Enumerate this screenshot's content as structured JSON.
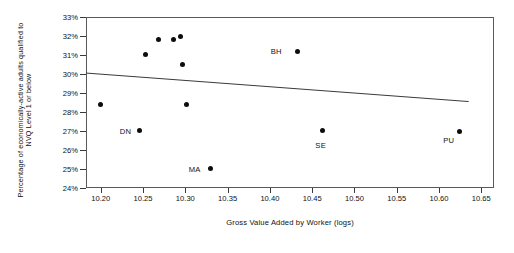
{
  "chart_data": {
    "type": "scatter",
    "title": "",
    "xlabel": "Gross Value Added by Worker (logs)",
    "ylabel": "Percentage of economically-active adults qualified to NVQ Level 1 or below",
    "ylabel_line1": "Percentage of economically-active adults qualified to",
    "ylabel_line2": "NVQ Level 1 or below",
    "xlim": [
      10.1825,
      10.665
    ],
    "ylim": [
      24,
      33
    ],
    "xticks": [
      "10.20",
      "10.25",
      "10.30",
      "10.35",
      "10.40",
      "10.45",
      "10.50",
      "10.55",
      "10.60",
      "10.65"
    ],
    "xtick_values": [
      10.2,
      10.25,
      10.3,
      10.35,
      10.4,
      10.45,
      10.5,
      10.55,
      10.6,
      10.65
    ],
    "yticks": [
      "24%",
      "25%",
      "26%",
      "27%",
      "28%",
      "29%",
      "30%",
      "31%",
      "32%",
      "33%"
    ],
    "ytick_values": [
      24,
      25,
      26,
      27,
      28,
      29,
      30,
      31,
      32,
      33
    ],
    "grid": false,
    "legend": "none",
    "marker_color": "#0d0d0d",
    "line_color": "#3a3a3a",
    "frame_color": "#5a5a5a",
    "points": [
      {
        "x": 10.2,
        "y": 28.4,
        "label": ""
      },
      {
        "x": 10.246,
        "y": 27.05,
        "label": "DN",
        "label_dx": -20,
        "label_dy": 1
      },
      {
        "x": 10.253,
        "y": 31.05,
        "label": ""
      },
      {
        "x": 10.268,
        "y": 31.8,
        "label": ""
      },
      {
        "x": 10.286,
        "y": 31.8,
        "label": ""
      },
      {
        "x": 10.294,
        "y": 32.0,
        "label": ""
      },
      {
        "x": 10.297,
        "y": 30.5,
        "label": ""
      },
      {
        "x": 10.301,
        "y": 28.4,
        "label": ""
      },
      {
        "x": 10.33,
        "y": 25.05,
        "label": "MA",
        "label_dx": -22,
        "label_dy": 1
      },
      {
        "x": 10.433,
        "y": 31.2,
        "label": "BH",
        "label_dx": -27,
        "label_dy": 0
      },
      {
        "x": 10.462,
        "y": 27.05,
        "label": "SE",
        "label_dx": -7,
        "label_dy": 15
      },
      {
        "x": 10.624,
        "y": 27.0,
        "label": "PU",
        "label_dx": -16,
        "label_dy": 9
      }
    ],
    "trendline": {
      "x0": 10.1825,
      "y0": 30.05,
      "x1": 10.635,
      "y1": 28.55,
      "description": "fitted regression line, slight negative slope"
    }
  }
}
